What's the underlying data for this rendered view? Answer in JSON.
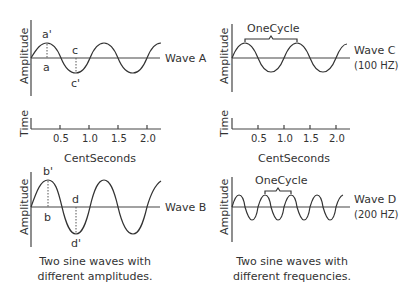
{
  "panels": {
    "wave_a": {
      "name": "Wave A",
      "y_label": "Amplitude",
      "markers": {
        "peak_top": "a'",
        "peak_bottom": "a",
        "trough_top": "c",
        "trough_bottom": "c'"
      }
    },
    "wave_c": {
      "name": "Wave C",
      "freq": "(100 HZ)",
      "y_label": "Amplitude",
      "brace_label": "OneCycle"
    },
    "time_left": {
      "y_label": "Time",
      "x_label": "CentSeconds",
      "ticks": [
        "0.5",
        "1.0",
        "1.5",
        "2.0"
      ]
    },
    "time_right": {
      "y_label": "Time",
      "x_label": "CentSeconds",
      "ticks": [
        "0.5",
        "1.0",
        "1.5",
        "2.0"
      ]
    },
    "wave_b": {
      "name": "Wave B",
      "y_label": "Amplitude",
      "markers": {
        "peak_top": "b'",
        "peak_bottom": "b",
        "trough_top": "d",
        "trough_bottom": "d'"
      }
    },
    "wave_d": {
      "name": "Wave D",
      "freq": "(200 HZ)",
      "y_label": "Amplitude",
      "brace_label": "OneCycle"
    }
  },
  "captions": {
    "left_line1": "Two sine waves with",
    "left_line2": "different amplitudes.",
    "right_line1": "Two sine waves with",
    "right_line2": "different frequencies."
  }
}
